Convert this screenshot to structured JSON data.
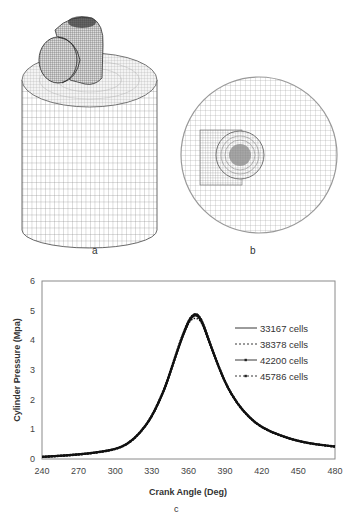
{
  "panels": {
    "a": {
      "label": "a",
      "description": "3D cylinder mesh with intake port"
    },
    "b": {
      "label": "b",
      "description": "Top view of cylinder head mesh"
    },
    "c": {
      "label": "c"
    }
  },
  "chart_data": {
    "type": "line",
    "title": "",
    "xlabel": "Crank Angle (Deg)",
    "ylabel": "Cylinder Pressure (Mpa)",
    "xlim": [
      240,
      480
    ],
    "ylim": [
      0,
      6
    ],
    "xticks": [
      240,
      270,
      300,
      330,
      360,
      390,
      420,
      450,
      480
    ],
    "yticks": [
      0,
      1,
      2,
      3,
      4,
      5,
      6
    ],
    "grid": false,
    "legend_position": "upper right (inside)",
    "x": [
      240,
      260,
      280,
      300,
      310,
      320,
      330,
      340,
      345,
      350,
      355,
      360,
      363,
      366,
      369,
      372,
      375,
      380,
      390,
      400,
      410,
      420,
      435,
      450,
      465,
      480
    ],
    "series": [
      {
        "name": "33167 cells",
        "style": "solid",
        "values": [
          0.07,
          0.12,
          0.19,
          0.32,
          0.5,
          0.85,
          1.4,
          2.3,
          2.9,
          3.5,
          4.1,
          4.6,
          4.78,
          4.85,
          4.75,
          4.5,
          4.15,
          3.6,
          2.55,
          1.85,
          1.38,
          1.05,
          0.78,
          0.6,
          0.49,
          0.42
        ]
      },
      {
        "name": "38378 cells",
        "style": "dotted",
        "values": [
          0.07,
          0.12,
          0.19,
          0.32,
          0.5,
          0.85,
          1.4,
          2.3,
          2.9,
          3.5,
          4.1,
          4.58,
          4.72,
          4.75,
          4.7,
          4.48,
          4.15,
          3.6,
          2.55,
          1.85,
          1.38,
          1.05,
          0.78,
          0.6,
          0.49,
          0.42
        ]
      },
      {
        "name": "42200 cells",
        "style": "solid-marker",
        "values": [
          0.07,
          0.12,
          0.19,
          0.32,
          0.5,
          0.86,
          1.42,
          2.32,
          2.92,
          3.55,
          4.15,
          4.65,
          4.83,
          4.9,
          4.8,
          4.55,
          4.2,
          3.62,
          2.56,
          1.86,
          1.39,
          1.06,
          0.79,
          0.6,
          0.49,
          0.42
        ]
      },
      {
        "name": "45786 cells",
        "style": "dotted-marker",
        "values": [
          0.07,
          0.12,
          0.19,
          0.32,
          0.5,
          0.86,
          1.42,
          2.32,
          2.92,
          3.55,
          4.15,
          4.65,
          4.83,
          4.9,
          4.8,
          4.55,
          4.2,
          3.62,
          2.56,
          1.86,
          1.39,
          1.06,
          0.79,
          0.6,
          0.49,
          0.42
        ]
      }
    ],
    "legend": [
      "33167 cells",
      "38378 cells",
      "42200 cells",
      "45786 cells"
    ]
  },
  "colors": {
    "line": "#111111",
    "frame": "#8a8a8a",
    "mesh": "#555555"
  }
}
